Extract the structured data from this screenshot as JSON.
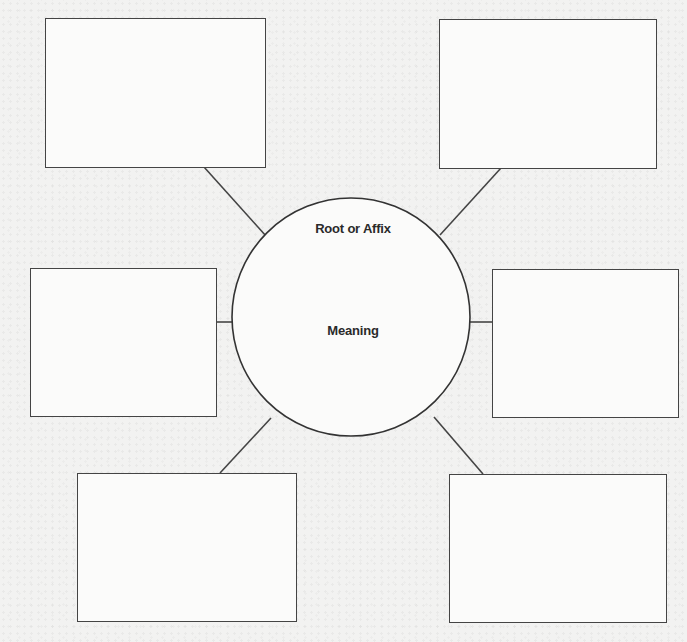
{
  "diagram": {
    "type": "word-web graphic organizer",
    "hub": {
      "title": "Root or Affix",
      "subtitle": "Meaning"
    },
    "boxes": [
      {
        "id": "top-left",
        "text": ""
      },
      {
        "id": "top-right",
        "text": ""
      },
      {
        "id": "middle-left",
        "text": ""
      },
      {
        "id": "middle-right",
        "text": ""
      },
      {
        "id": "bottom-left",
        "text": ""
      },
      {
        "id": "bottom-right",
        "text": ""
      }
    ],
    "colors": {
      "stroke": "#444444",
      "background": "#f2f2f1",
      "box_fill": "#fbfbfa",
      "text": "#2a2a2a"
    }
  }
}
